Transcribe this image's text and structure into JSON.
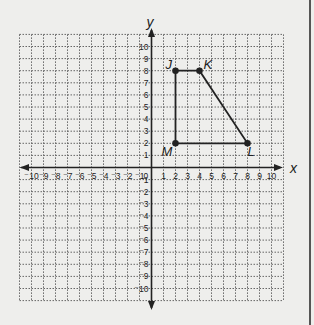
{
  "figure": {
    "x_axis_label": "x",
    "y_axis_label": "y",
    "x_range": [
      -10,
      10
    ],
    "y_range": [
      -10,
      10
    ],
    "origin_label": "0",
    "grid": "dotted",
    "x_tick_labels": [
      "-10",
      "-9",
      "-8",
      "-7",
      "-6",
      "-5",
      "-4",
      "-3",
      "-2",
      "-1",
      "1",
      "2",
      "3",
      "4",
      "5",
      "6",
      "7",
      "8",
      "9",
      "10"
    ],
    "y_tick_labels": [
      "10",
      "9",
      "8",
      "7",
      "6",
      "5",
      "4",
      "3",
      "2",
      "1",
      "-1",
      "-2",
      "-3",
      "-4",
      "-5",
      "-6",
      "-7",
      "-8",
      "-9",
      "-10"
    ]
  },
  "polygon": {
    "name": "JKLM",
    "vertices": [
      {
        "label": "J",
        "x": 2,
        "y": 8
      },
      {
        "label": "K",
        "x": 4,
        "y": 8
      },
      {
        "label": "L",
        "x": 8,
        "y": 2
      },
      {
        "label": "M",
        "x": 2,
        "y": 2
      }
    ]
  },
  "colors": {
    "background": "#eeeeec",
    "grid": "#666666",
    "axis": "#222222",
    "shape": "#222222"
  }
}
